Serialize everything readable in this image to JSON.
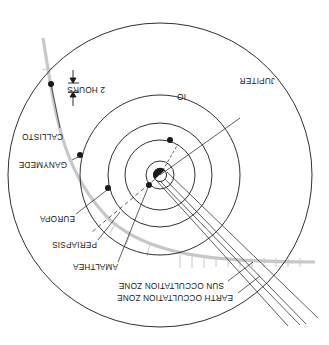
{
  "diagram": {
    "title": "",
    "orientation": "rotated-180",
    "colors": {
      "ink": "#1a1a1a",
      "trajectory": "#c8c8c8",
      "background": "#ffffff"
    },
    "center": {
      "name": "Jupiter",
      "x": 160,
      "y": 175
    },
    "orbits": [
      {
        "name": "amalthea-orbit",
        "r": 14
      },
      {
        "name": "io-orbit",
        "r": 35
      },
      {
        "name": "europa-orbit",
        "r": 52
      },
      {
        "name": "ganymede-orbit",
        "r": 80
      },
      {
        "name": "callisto-orbit",
        "r": 150
      }
    ],
    "labels": {
      "jupiter": "JUPITER",
      "io": "IO",
      "callisto": "CALLISTO",
      "ganymede": "GANYMEDE",
      "europa": "EUROPA",
      "periapsis": "PERIAPSIS",
      "amalthea": "AMALTHEA",
      "sun_zone": "SUN OCCULTATION ZONE",
      "earth_zone": "EARTH OCCULTATION ZONE",
      "two_hours": "2 HOURS"
    }
  }
}
